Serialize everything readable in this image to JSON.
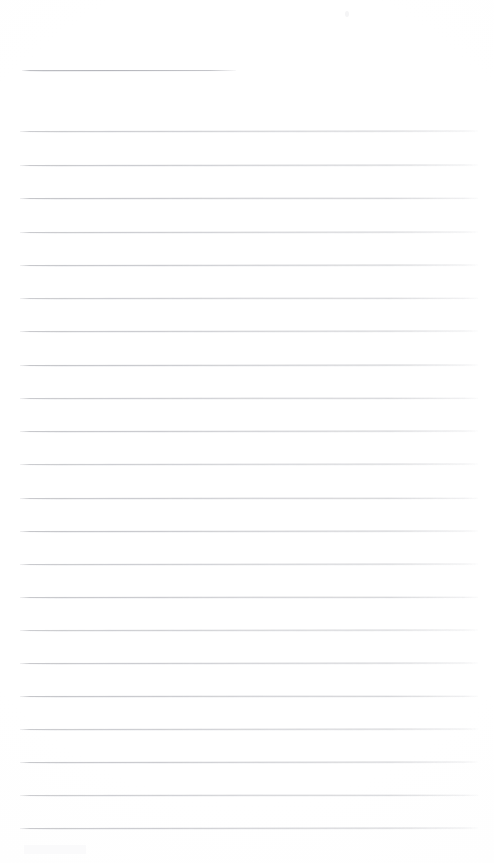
{
  "document": {
    "kind": "scanned-lined-page",
    "title": "Blank Ruled Notebook Page",
    "content_text": "",
    "page_width": 494,
    "page_height": 863,
    "background_color": "#ffffff",
    "rule_color": "#c2c3c7",
    "rule_thickness_px": 1,
    "is_blank": "true",
    "handwriting_present": "false"
  },
  "title_rule": {
    "label": "title-rule",
    "x": 22,
    "y": 70,
    "width": 214,
    "color": "#b5b6bc"
  },
  "ruled_lines": {
    "label": "ruled-lines",
    "count": 22,
    "first_y": 131,
    "spacing": 33.2,
    "left": 20,
    "right": 478,
    "width": 458,
    "lines": [
      {
        "index": 1,
        "y": 131
      },
      {
        "index": 2,
        "y": 165
      },
      {
        "index": 3,
        "y": 198
      },
      {
        "index": 4,
        "y": 232
      },
      {
        "index": 5,
        "y": 265
      },
      {
        "index": 6,
        "y": 298
      },
      {
        "index": 7,
        "y": 331
      },
      {
        "index": 8,
        "y": 365
      },
      {
        "index": 9,
        "y": 398
      },
      {
        "index": 10,
        "y": 431
      },
      {
        "index": 11,
        "y": 464
      },
      {
        "index": 12,
        "y": 498
      },
      {
        "index": 13,
        "y": 531
      },
      {
        "index": 14,
        "y": 564
      },
      {
        "index": 15,
        "y": 597
      },
      {
        "index": 16,
        "y": 630
      },
      {
        "index": 17,
        "y": 663
      },
      {
        "index": 18,
        "y": 696
      },
      {
        "index": 19,
        "y": 729
      },
      {
        "index": 20,
        "y": 762
      },
      {
        "index": 21,
        "y": 795
      },
      {
        "index": 22,
        "y": 828
      }
    ]
  },
  "artifacts": {
    "label": "scan-artifacts",
    "items": [
      {
        "name": "top-speck",
        "x": 345,
        "y": 11,
        "w": 4,
        "h": 6
      },
      {
        "name": "bottom-smudge",
        "x": 24,
        "y": 845,
        "w": 62,
        "h": 9
      }
    ]
  }
}
